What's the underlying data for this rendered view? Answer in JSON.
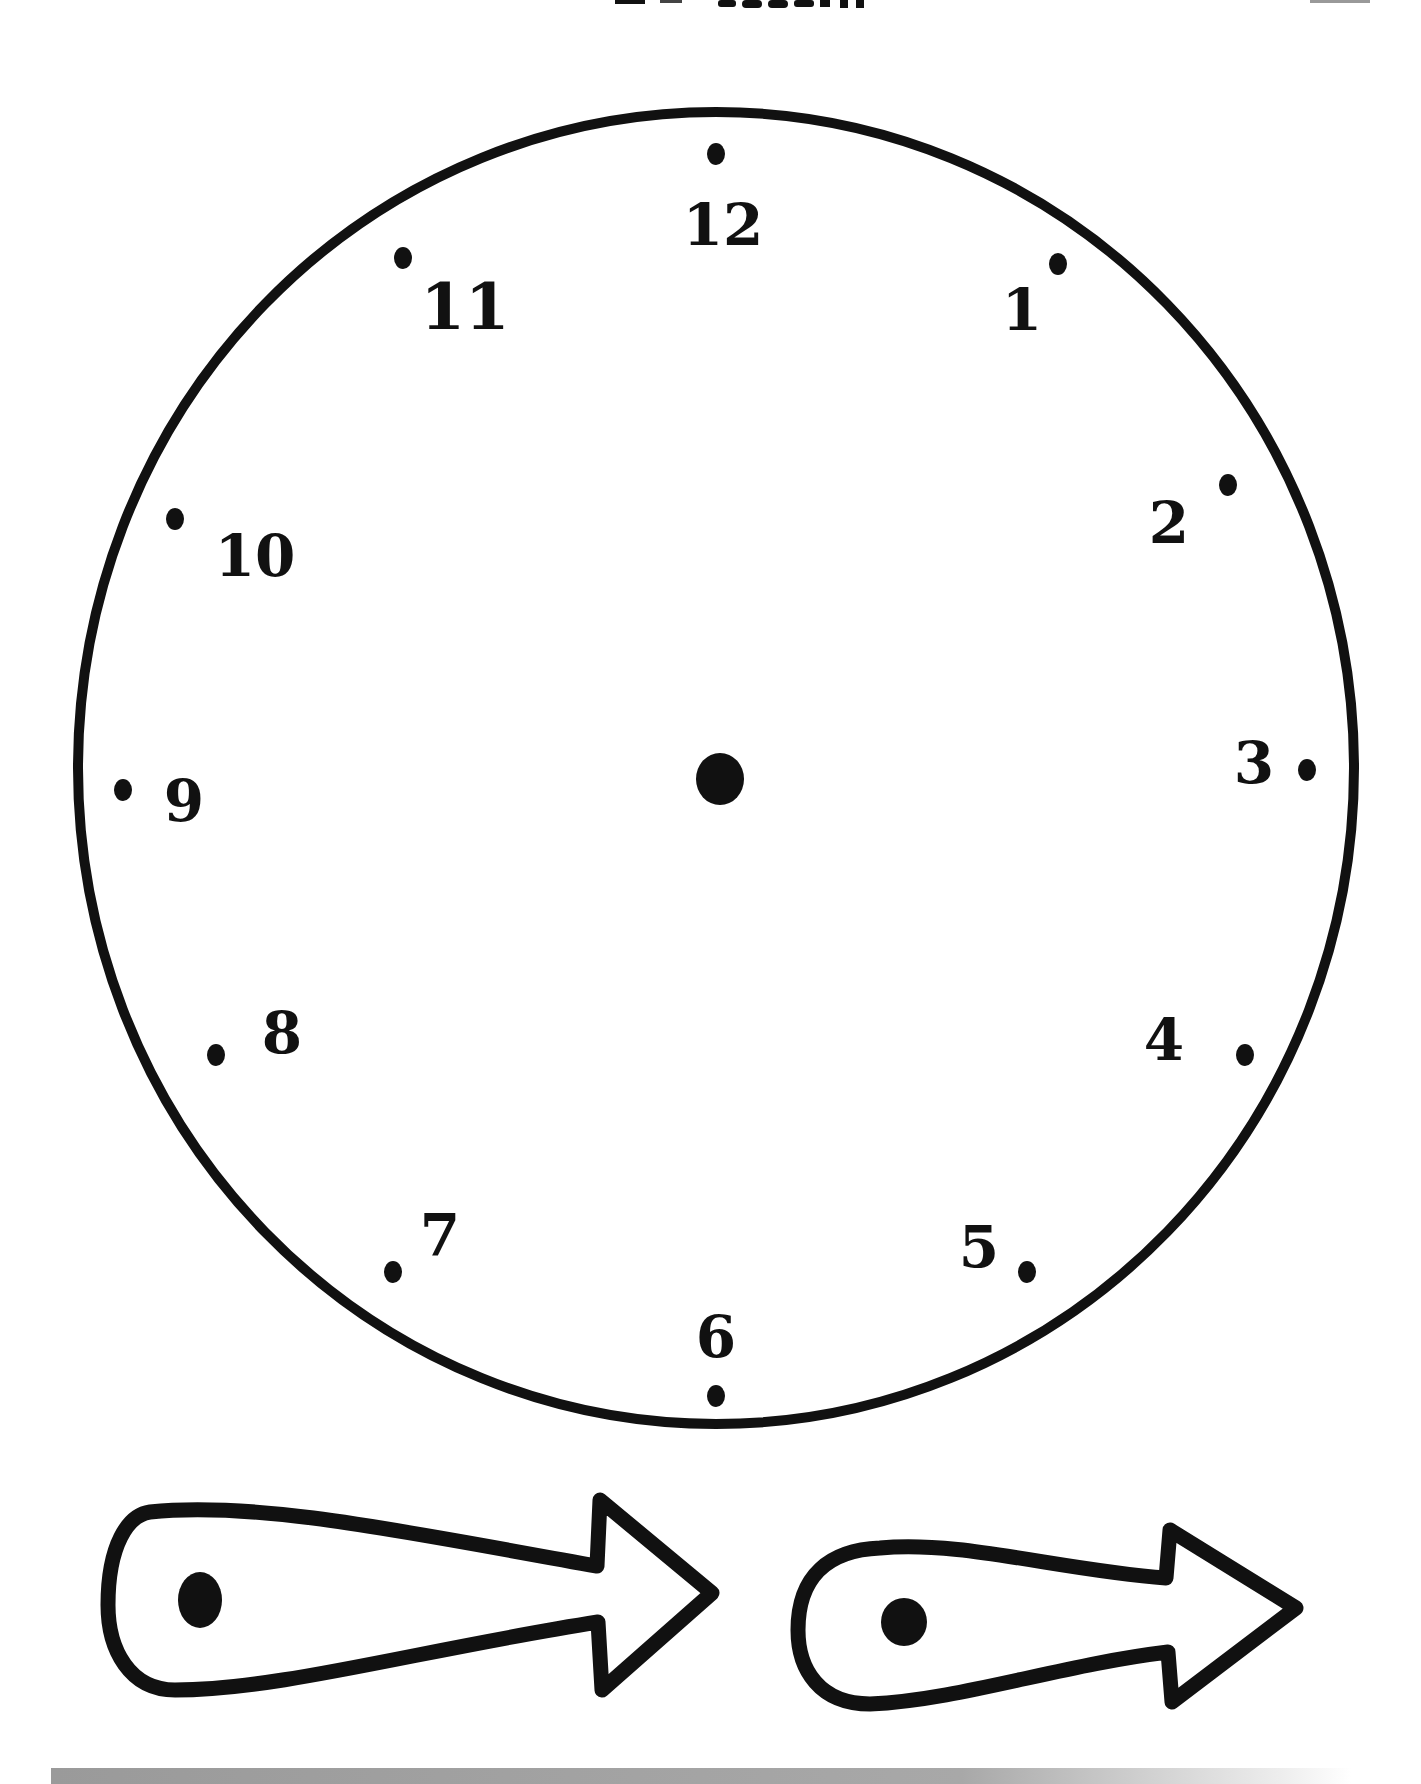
{
  "page": {
    "title_fragment": "",
    "background": "#ffffff",
    "ink_color": "#111111",
    "bar_color": "#9a9a9a"
  },
  "clock": {
    "face": {
      "cx": 716,
      "cy": 768,
      "rx": 638,
      "ry": 656,
      "stroke_width": 10
    },
    "center_pin": {
      "cx": 720,
      "cy": 779,
      "rx": 24,
      "ry": 26
    },
    "numerals": [
      {
        "label": "12",
        "x": 723,
        "y": 225,
        "size": 58,
        "dot_x": 716,
        "dot_y": 154
      },
      {
        "label": "1",
        "x": 1022,
        "y": 310,
        "size": 58,
        "dot_x": 1058,
        "dot_y": 264
      },
      {
        "label": "2",
        "x": 1169,
        "y": 523,
        "size": 58,
        "dot_x": 1228,
        "dot_y": 485
      },
      {
        "label": "3",
        "x": 1254,
        "y": 763,
        "size": 58,
        "dot_x": 1307,
        "dot_y": 770
      },
      {
        "label": "4",
        "x": 1164,
        "y": 1040,
        "size": 58,
        "dot_x": 1245,
        "dot_y": 1055
      },
      {
        "label": "5",
        "x": 979,
        "y": 1247,
        "size": 58,
        "dot_x": 1027,
        "dot_y": 1272
      },
      {
        "label": "6",
        "x": 716,
        "y": 1337,
        "size": 58,
        "dot_x": 716,
        "dot_y": 1396
      },
      {
        "label": "7",
        "x": 440,
        "y": 1235,
        "size": 58,
        "dot_x": 393,
        "dot_y": 1272
      },
      {
        "label": "8",
        "x": 282,
        "y": 1033,
        "size": 58,
        "dot_x": 216,
        "dot_y": 1055
      },
      {
        "label": "9",
        "x": 184,
        "y": 801,
        "size": 58,
        "dot_x": 123,
        "dot_y": 790
      },
      {
        "label": "10",
        "x": 255,
        "y": 556,
        "size": 58,
        "dot_x": 175,
        "dot_y": 519
      },
      {
        "label": "11",
        "x": 465,
        "y": 306,
        "size": 64,
        "dot_x": 403,
        "dot_y": 258
      }
    ]
  },
  "hands": [
    {
      "name": "hour-hand",
      "pivot_dot": {
        "cx": 200,
        "cy": 1600,
        "rx": 22,
        "ry": 28
      }
    },
    {
      "name": "minute-hand",
      "pivot_dot": {
        "cx": 904,
        "cy": 1622,
        "rx": 23,
        "ry": 24
      }
    }
  ]
}
